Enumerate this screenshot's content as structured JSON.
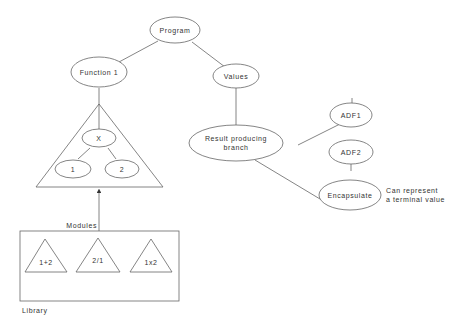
{
  "diagram": {
    "nodes": {
      "program": "Program",
      "function1": "Function 1",
      "values": "Values",
      "x": "X",
      "one": "1",
      "two": "2",
      "result_line1": "Result producing",
      "result_line2": "branch",
      "adf1": "ADF1",
      "adf2": "ADF2",
      "encapsulate": "Encapsulate"
    },
    "labels": {
      "modules": "Modules",
      "library": "Library",
      "note_line1": "Can represent",
      "note_line2": "a terminal value"
    },
    "library_modules": [
      "1+2",
      "2/1",
      "1x2"
    ],
    "edges": [
      [
        "Program",
        "Function 1"
      ],
      [
        "Program",
        "Values"
      ],
      [
        "Function 1",
        "Function triangle"
      ],
      [
        "X",
        "1"
      ],
      [
        "X",
        "2"
      ],
      [
        "Values",
        "Result producing branch"
      ],
      [
        "Result producing branch",
        "ADF1"
      ],
      [
        "ADF1",
        "ADF2"
      ],
      [
        "ADF2",
        "Encapsulate"
      ],
      [
        "Result producing branch",
        "Encapsulate"
      ],
      [
        "Library",
        "Function triangle (Modules arrow)"
      ]
    ],
    "colors": {
      "stroke": "#666666",
      "text": "#333333",
      "background": "#ffffff"
    }
  }
}
